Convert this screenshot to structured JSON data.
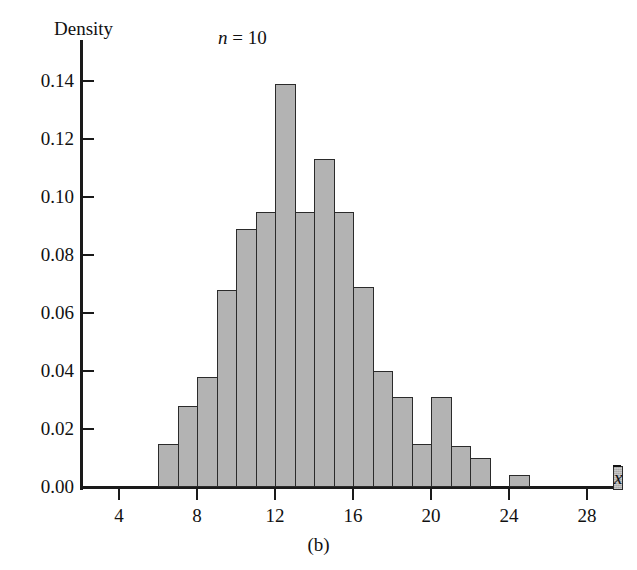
{
  "figure": {
    "caption": "(b)",
    "title": "n = 10",
    "title_symbol": "n",
    "title_rest": " = 10"
  },
  "chart_data": {
    "type": "bar",
    "title": "n = 10",
    "xlabel": "x̄",
    "ylabel": "Density",
    "grid": false,
    "legend": false,
    "xlim": [
      2,
      30
    ],
    "ylim": [
      0.0,
      0.15
    ],
    "bin_width": 1,
    "x_ticks": [
      4,
      8,
      12,
      16,
      20,
      24,
      28
    ],
    "x_tick_labels": [
      "4",
      "8",
      "12",
      "16",
      "20",
      "24",
      "28"
    ],
    "y_ticks": [
      0.0,
      0.02,
      0.04,
      0.06,
      0.08,
      0.1,
      0.12,
      0.14
    ],
    "y_tick_labels": [
      "0.00",
      "0.02",
      "0.04",
      "0.06",
      "0.08",
      "0.10",
      "0.12",
      "0.14"
    ],
    "bin_left_edges": [
      6,
      7,
      8,
      9,
      10,
      11,
      12,
      13,
      14,
      15,
      16,
      17,
      18,
      19,
      20,
      21,
      22,
      24
    ],
    "categories": [
      "6-7",
      "7-8",
      "8-9",
      "9-10",
      "10-11",
      "11-12",
      "12-13",
      "13-14",
      "14-15",
      "15-16",
      "16-17",
      "17-18",
      "18-19",
      "19-20",
      "20-21",
      "21-22",
      "22-23",
      "24-25"
    ],
    "values": [
      0.015,
      0.028,
      0.038,
      0.068,
      0.089,
      0.095,
      0.139,
      0.095,
      0.113,
      0.095,
      0.069,
      0.04,
      0.031,
      0.015,
      0.031,
      0.014,
      0.01,
      0.004
    ],
    "bar_color": "#b3b3b3",
    "bar_edge_color": "#2b2b2b"
  }
}
